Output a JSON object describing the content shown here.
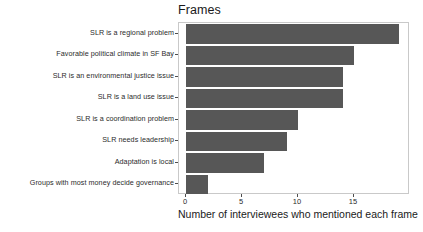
{
  "chart_data": {
    "type": "bar",
    "orientation": "horizontal",
    "title": "Frames",
    "xlabel": "Number of interviewees who mentioned each frame",
    "ylabel": "",
    "xlim": [
      0,
      19.6
    ],
    "xticks": [
      0,
      5,
      10,
      15
    ],
    "xtick_labels": [
      "0",
      "5",
      "10",
      "15"
    ],
    "grid": false,
    "legend": null,
    "bar_color": "#575757",
    "panel_background": "#ffffff",
    "panel_border_color": "#c9c9c9",
    "categories": [
      "SLR is a regional problem",
      "Favorable political climate in SF Bay",
      "SLR is an environmental justice issue",
      "SLR is a land use issue",
      "SLR is a coordination problem",
      "SLR needs leadership",
      "Adaptation is local",
      "Groups with most money decide governance"
    ],
    "values": [
      19,
      15,
      14,
      14,
      10,
      9,
      7,
      2
    ]
  },
  "footer": {
    "clipped_caption": ""
  }
}
